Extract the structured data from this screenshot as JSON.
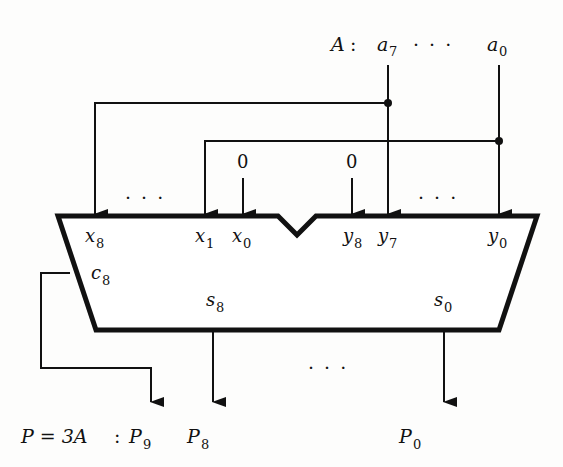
{
  "input": {
    "name": "A",
    "separator": ":",
    "msb": {
      "base": "a",
      "sub": "7"
    },
    "lsb": {
      "base": "a",
      "sub": "0"
    },
    "ellipsis": "· · ·"
  },
  "adder": {
    "x_ports": [
      {
        "base": "x",
        "sub": "8"
      },
      {
        "base": "x",
        "sub": "1"
      },
      {
        "base": "x",
        "sub": "0"
      }
    ],
    "y_ports": [
      {
        "base": "y",
        "sub": "8"
      },
      {
        "base": "y",
        "sub": "7"
      },
      {
        "base": "y",
        "sub": "0"
      }
    ],
    "carry_out": {
      "base": "c",
      "sub": "8"
    },
    "sum_ports": [
      {
        "base": "s",
        "sub": "8"
      },
      {
        "base": "s",
        "sub": "0"
      }
    ],
    "x_ellipsis": "· · ·",
    "y_ellipsis": "· · ·",
    "zero_x0": "0",
    "zero_y8": "0"
  },
  "output": {
    "expression": "P = 3A",
    "separator": ":",
    "bits": [
      {
        "base": "P",
        "sub": "9"
      },
      {
        "base": "P",
        "sub": "8"
      },
      {
        "base": "P",
        "sub": "0"
      }
    ],
    "ellipsis": "· · ·"
  },
  "colors": {
    "ink": "#111111",
    "background": "#fdfdfc"
  }
}
